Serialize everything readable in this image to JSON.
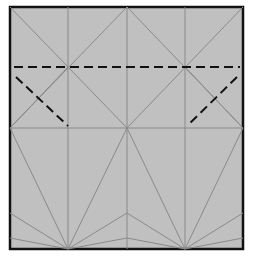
{
  "diagram": {
    "type": "origami-crease-pattern",
    "colors": {
      "paper": "#c0c0c0",
      "border": "#111111",
      "crease": "#8a8a8a",
      "fold_line": "#111111",
      "background": "#ffffff"
    },
    "square": {
      "x": 10,
      "y": 7,
      "width": 233,
      "height": 242
    },
    "vertical_creases_x": [
      68,
      127,
      185
    ],
    "horizontal_creases_y": [
      128
    ],
    "valley_fold_lines": [
      {
        "x1": 14,
        "y1": 67,
        "x2": 240,
        "y2": 67
      },
      {
        "x1": 16,
        "y1": 77,
        "x2": 68,
        "y2": 126
      },
      {
        "x1": 237,
        "y1": 77,
        "x2": 187,
        "y2": 126
      }
    ]
  }
}
